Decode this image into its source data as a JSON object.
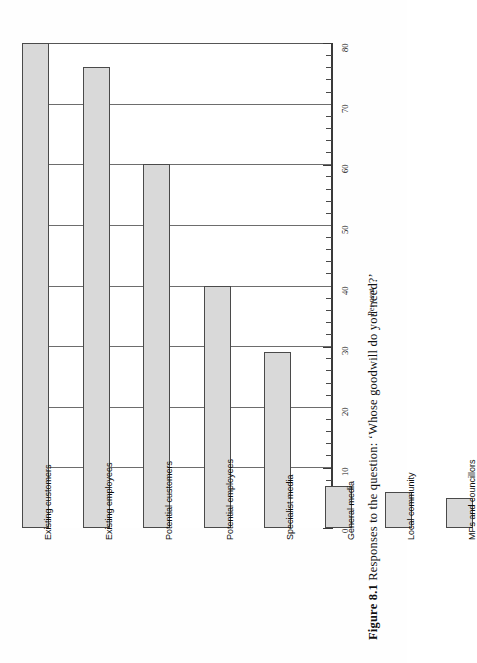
{
  "caption": {
    "label": "Figure 8.1",
    "text": "Responses to the question: ‘Whose goodwill do you need?’"
  },
  "chart_data": {
    "type": "bar",
    "orientation": "vertical-bars-rotated",
    "title": "",
    "xlabel": "",
    "ylabel": "Per cent",
    "ylim": [
      0,
      80
    ],
    "ytick_step": 10,
    "yminor_step": 2,
    "grid": true,
    "legend": "none",
    "categories": [
      "Existing customers",
      "Existing employees",
      "Potential customers",
      "Potential employees",
      "Specialist media",
      "General media",
      "Local community",
      "MPs and councillors"
    ],
    "values": [
      80,
      76,
      60,
      40,
      29,
      7,
      6,
      5
    ],
    "tick_labels": [
      "0",
      "10",
      "20",
      "30",
      "40",
      "50",
      "60",
      "70",
      "80"
    ],
    "bar_fill": "#d9d9d9",
    "bar_stroke": "#4a4a4a"
  }
}
